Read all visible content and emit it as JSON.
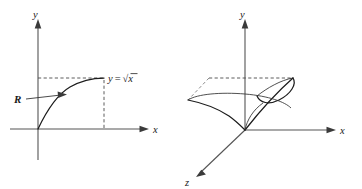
{
  "figure": {
    "background_color": "#ffffff",
    "ink_color": "#1a1a1a",
    "axis_color": "#555555",
    "panels": [
      {
        "id": "figure-2d",
        "name": "region-under-sqrt-curve",
        "axes": {
          "x_label": "x",
          "y_label": "y"
        },
        "curve_label": {
          "lhs": "y",
          "equals": "=",
          "radical": "√",
          "radicand": "x",
          "full": "y = √x"
        },
        "region_label": "R",
        "dashed_guides": [
          "horizontal-from-y-axis-to-curve-end",
          "vertical-from-curve-end-to-x-axis"
        ]
      },
      {
        "id": "figure-3d",
        "name": "solid-of-revolution",
        "axes": {
          "x_label": "x",
          "y_label": "y",
          "z_label": "z"
        },
        "dashed_guides": [
          "horizontal-top-edge",
          "diagonal-left-edge"
        ]
      }
    ]
  }
}
